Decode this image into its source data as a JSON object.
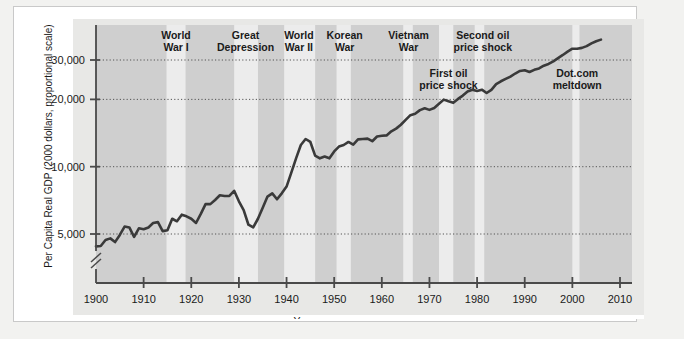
{
  "chart_data": {
    "type": "line",
    "title": "",
    "xlabel": "Year",
    "ylabel": "Per Capita Real GDP (2000 dollars, proportional scale)",
    "yscale": "log",
    "ylim": [
      3800,
      40000
    ],
    "xlim": [
      1900,
      2012
    ],
    "grid": true,
    "axis_break": true,
    "yticks": [
      5000,
      10000,
      20000,
      30000
    ],
    "ytick_labels": [
      "5,000",
      "10,000",
      "20,000",
      "30,000"
    ],
    "xticks": [
      1900,
      1910,
      1920,
      1930,
      1940,
      1950,
      1960,
      1970,
      1980,
      1990,
      2000,
      2010
    ],
    "xtick_labels": [
      "1900",
      "1910",
      "1920",
      "1930",
      "1940",
      "1950",
      "1960",
      "1970",
      "1980",
      "1990",
      "2000",
      "2010"
    ],
    "legend": "none",
    "series": [
      {
        "name": "Per Capita Real GDP",
        "color": "#3a3a3a",
        "x": [
          1900,
          1901,
          1902,
          1903,
          1904,
          1905,
          1906,
          1907,
          1908,
          1909,
          1910,
          1911,
          1912,
          1913,
          1914,
          1915,
          1916,
          1917,
          1918,
          1919,
          1920,
          1921,
          1922,
          1923,
          1924,
          1925,
          1926,
          1927,
          1928,
          1929,
          1930,
          1931,
          1932,
          1933,
          1934,
          1935,
          1936,
          1937,
          1938,
          1939,
          1940,
          1941,
          1942,
          1943,
          1944,
          1945,
          1946,
          1947,
          1948,
          1949,
          1950,
          1951,
          1952,
          1953,
          1954,
          1955,
          1956,
          1957,
          1958,
          1959,
          1960,
          1961,
          1962,
          1963,
          1964,
          1965,
          1966,
          1967,
          1968,
          1969,
          1970,
          1971,
          1972,
          1973,
          1974,
          1975,
          1976,
          1977,
          1978,
          1979,
          1980,
          1981,
          1982,
          1983,
          1984,
          1985,
          1986,
          1987,
          1988,
          1989,
          1990,
          1991,
          1992,
          1993,
          1994,
          1995,
          1996,
          1997,
          1998,
          1999,
          2000,
          2001,
          2002,
          2003,
          2004,
          2005,
          2006
        ],
        "values": [
          4400,
          4420,
          4700,
          4780,
          4600,
          4950,
          5400,
          5350,
          4850,
          5300,
          5250,
          5350,
          5600,
          5650,
          5150,
          5200,
          5850,
          5700,
          6100,
          6000,
          5850,
          5600,
          6150,
          6800,
          6800,
          7100,
          7450,
          7400,
          7400,
          7800,
          7000,
          6400,
          5500,
          5350,
          5850,
          6550,
          7350,
          7600,
          7150,
          7600,
          8150,
          9400,
          10900,
          12500,
          13300,
          12900,
          11200,
          10900,
          11100,
          10900,
          11700,
          12300,
          12500,
          12900,
          12550,
          13250,
          13300,
          13350,
          13000,
          13650,
          13750,
          13800,
          14400,
          14800,
          15400,
          16200,
          17000,
          17250,
          17900,
          18250,
          17950,
          18300,
          19100,
          19950,
          19600,
          19300,
          20100,
          20800,
          21700,
          22100,
          21800,
          22100,
          21350,
          22050,
          23400,
          24100,
          24700,
          25300,
          26100,
          26800,
          27000,
          26500,
          27100,
          27500,
          28300,
          28800,
          29600,
          30600,
          31600,
          32700,
          33700,
          33700,
          34000,
          34600,
          35600,
          36400,
          37000
        ]
      }
    ],
    "shaded_bands": [
      {
        "label": "World War I",
        "start": 1914.8,
        "end": 1918.8,
        "type": "light"
      },
      {
        "label": "Great Depression",
        "start": 1929.0,
        "end": 1934.0,
        "type": "light"
      },
      {
        "label": "World War II",
        "start": 1939.5,
        "end": 1946.0,
        "type": "light"
      },
      {
        "label": "Korean War",
        "start": 1950.5,
        "end": 1953.5,
        "type": "light"
      },
      {
        "label": "Vietnam War",
        "start": 1964.5,
        "end": 1966.5,
        "type": "light"
      },
      {
        "label": "First oil price shock",
        "start": 1972.0,
        "end": 1975.0,
        "type": "light"
      },
      {
        "label": "Second oil price shock",
        "start": 1979.5,
        "end": 1981.5,
        "type": "light"
      },
      {
        "label": "Dot.com meltdown",
        "start": 2000.0,
        "end": 2001.5,
        "type": "light"
      }
    ],
    "annotations": [
      {
        "text_lines": [
          "World",
          "War I"
        ],
        "x": 1916.8,
        "y_px": 20,
        "align": "middle"
      },
      {
        "text_lines": [
          "Great",
          "Depression"
        ],
        "x": 1931.4,
        "y_px": 20,
        "align": "middle"
      },
      {
        "text_lines": [
          "World",
          "War II"
        ],
        "x": 1942.6,
        "y_px": 20,
        "align": "middle"
      },
      {
        "text_lines": [
          "Korean",
          "War"
        ],
        "x": 1952.2,
        "y_px": 20,
        "align": "middle"
      },
      {
        "text_lines": [
          "Vietnam",
          "War"
        ],
        "x": 1965.6,
        "y_px": 20,
        "align": "middle"
      },
      {
        "text_lines": [
          "Second oil",
          "price shock"
        ],
        "x": 1981.2,
        "y_px": 20,
        "align": "middle"
      },
      {
        "text_lines": [
          "First oil",
          "price shock"
        ],
        "x": 1974.0,
        "y_px": 58,
        "align": "middle"
      },
      {
        "text_lines": [
          "Dot.com",
          "meltdown"
        ],
        "x": 2001.0,
        "y_px": 58,
        "align": "middle"
      }
    ],
    "colors": {
      "plot_bg_dark": "#cfcfcf",
      "plot_bg_light": "#ececec",
      "line": "#3a3a3a",
      "axis": "#4a4a4a",
      "grid": "#555555",
      "page": "#ffffff",
      "canvas": "#f2f2f0",
      "label_panel": "#e8e8e6"
    }
  }
}
